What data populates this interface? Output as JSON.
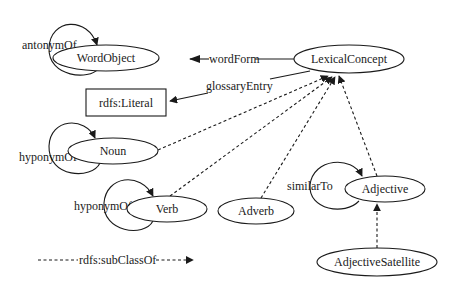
{
  "diagram": {
    "type": "ontology-graph",
    "nodes": {
      "word_object": {
        "label": "WordObject",
        "shape": "ellipse"
      },
      "lexical_concept": {
        "label": "LexicalConcept",
        "shape": "ellipse"
      },
      "rdfs_literal": {
        "label": "rdfs:Literal",
        "shape": "rectangle"
      },
      "noun": {
        "label": "Noun",
        "shape": "ellipse"
      },
      "verb": {
        "label": "Verb",
        "shape": "ellipse"
      },
      "adverb": {
        "label": "Adverb",
        "shape": "ellipse"
      },
      "adjective": {
        "label": "Adjective",
        "shape": "ellipse"
      },
      "adjective_satellite": {
        "label": "AdjectiveSatellite",
        "shape": "ellipse"
      }
    },
    "edges": {
      "antonym_of": {
        "label": "antonymOf",
        "from": "WordObject",
        "to": "WordObject",
        "style": "solid"
      },
      "word_form": {
        "label": "wordForm",
        "from": "LexicalConcept",
        "to": "WordObject",
        "style": "solid"
      },
      "glossary_entry": {
        "label": "glossaryEntry",
        "from": "LexicalConcept",
        "to": "rdfs:Literal",
        "style": "solid"
      },
      "noun_hyponym_of": {
        "label": "hyponymOf",
        "from": "Noun",
        "to": "Noun",
        "style": "solid"
      },
      "verb_hyponym_of": {
        "label": "hyponymOf",
        "from": "Verb",
        "to": "Verb",
        "style": "solid"
      },
      "similar_to": {
        "label": "similarTo",
        "from": "Adjective",
        "to": "Adjective",
        "style": "solid"
      },
      "noun_subclass": {
        "from": "Noun",
        "to": "LexicalConcept",
        "style": "dashed"
      },
      "verb_subclass": {
        "from": "Verb",
        "to": "LexicalConcept",
        "style": "dashed"
      },
      "adverb_subclass": {
        "from": "Adverb",
        "to": "LexicalConcept",
        "style": "dashed"
      },
      "adjective_subclass": {
        "from": "Adjective",
        "to": "LexicalConcept",
        "style": "dashed"
      },
      "satellite_subclass": {
        "from": "AdjectiveSatellite",
        "to": "Adjective",
        "style": "dashed"
      }
    },
    "legend": {
      "label": "rdfs:subClassOf",
      "style": "dashed"
    },
    "colors": {
      "stroke": "#1a1a1a",
      "background": "#ffffff"
    }
  }
}
